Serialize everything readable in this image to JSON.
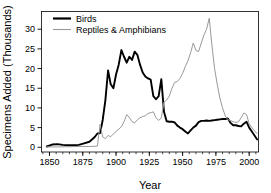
{
  "chart_data": {
    "type": "line",
    "title": "",
    "xlabel": "Year",
    "ylabel": "Specimens Added (Thousands)",
    "xlim": [
      1844,
      2007
    ],
    "ylim": [
      -1.2,
      34.5
    ],
    "xticks": [
      1850,
      1875,
      1900,
      1925,
      1950,
      1975,
      2000
    ],
    "yticks": [
      0,
      5,
      10,
      15,
      20,
      25,
      30
    ],
    "xtick_labels": [
      "1850",
      "1875",
      "1900",
      "1925",
      "1950",
      "1975",
      "2000"
    ],
    "ytick_labels": [
      "0",
      "5",
      "10",
      "15",
      "20",
      "25",
      "30"
    ],
    "minor_xtick_interval": 5,
    "grid": false,
    "legend_position": "top-left",
    "series": [
      {
        "name": "Birds",
        "color": "#000000",
        "line_width": 1.9,
        "x": [
          1848,
          1852,
          1856,
          1860,
          1864,
          1868,
          1872,
          1876,
          1880,
          1884,
          1886,
          1888,
          1890,
          1892,
          1894,
          1896,
          1898,
          1900,
          1902,
          1904,
          1906,
          1908,
          1910,
          1912,
          1914,
          1916,
          1918,
          1920,
          1922,
          1924,
          1926,
          1928,
          1930,
          1932,
          1934,
          1936,
          1938,
          1940,
          1942,
          1944,
          1946,
          1948,
          1950,
          1952,
          1954,
          1956,
          1958,
          1960,
          1962,
          1964,
          1966,
          1968,
          1970,
          1972,
          1974,
          1976,
          1978,
          1980,
          1982,
          1984,
          1986,
          1988,
          1990,
          1992,
          1994,
          1996,
          1998,
          2000,
          2002,
          2004,
          2006
        ],
        "y": [
          0.2,
          0.7,
          0.8,
          0.6,
          0.5,
          0.5,
          0.6,
          1.0,
          1.4,
          2.6,
          3.5,
          3.6,
          7.0,
          12.0,
          19.5,
          16.0,
          15.0,
          18.5,
          21.0,
          24.7,
          23.0,
          21.5,
          23.0,
          22.2,
          24.3,
          23.5,
          21.0,
          19.0,
          18.0,
          17.5,
          17.2,
          13.0,
          12.2,
          13.0,
          17.3,
          9.0,
          6.6,
          6.5,
          6.5,
          6.3,
          5.5,
          5.0,
          4.6,
          4.0,
          3.5,
          4.3,
          5.0,
          5.5,
          6.4,
          6.7,
          6.7,
          6.8,
          6.7,
          6.8,
          6.9,
          7.0,
          7.1,
          7.2,
          7.2,
          7.3,
          6.2,
          5.6,
          5.6,
          5.4,
          5.3,
          6.0,
          6.5,
          5.0,
          4.0,
          3.0,
          2.0
        ]
      },
      {
        "name": "Reptiles & Amphibians",
        "color": "#999999",
        "line_width": 1.0,
        "x": [
          1848,
          1856,
          1864,
          1872,
          1880,
          1884,
          1886,
          1888,
          1890,
          1892,
          1894,
          1896,
          1898,
          1900,
          1902,
          1904,
          1906,
          1908,
          1910,
          1912,
          1914,
          1916,
          1918,
          1920,
          1922,
          1924,
          1926,
          1928,
          1930,
          1932,
          1934,
          1936,
          1938,
          1940,
          1942,
          1944,
          1946,
          1948,
          1950,
          1952,
          1954,
          1956,
          1958,
          1960,
          1962,
          1964,
          1966,
          1968,
          1970,
          1972,
          1974,
          1976,
          1978,
          1980,
          1982,
          1984,
          1986,
          1988,
          1990,
          1992,
          1994,
          1996,
          1998,
          2000,
          2002,
          2004,
          2006
        ],
        "y": [
          0.1,
          0.1,
          0.15,
          0.2,
          0.2,
          0.25,
          0.3,
          5.8,
          2.6,
          2.2,
          3.0,
          2.7,
          3.4,
          4.0,
          4.6,
          5.2,
          6.5,
          8.3,
          7.6,
          6.5,
          6.2,
          7.0,
          7.5,
          7.8,
          8.0,
          8.6,
          8.8,
          9.0,
          7.5,
          6.8,
          7.5,
          11.5,
          12.0,
          13.0,
          15.0,
          16.5,
          16.7,
          17.5,
          18.8,
          20.5,
          22.0,
          24.0,
          26.5,
          24.6,
          24.3,
          26.5,
          28.5,
          30.0,
          32.8,
          26.0,
          20.0,
          16.0,
          12.5,
          10.0,
          8.0,
          7.0,
          6.8,
          6.5,
          6.3,
          6.5,
          7.5,
          8.7,
          8.3,
          6.0,
          5.0,
          4.2,
          3.5
        ]
      }
    ]
  },
  "legend": {
    "entries": [
      {
        "label": "Birds"
      },
      {
        "label": "Reptiles & Amphibians"
      }
    ]
  }
}
